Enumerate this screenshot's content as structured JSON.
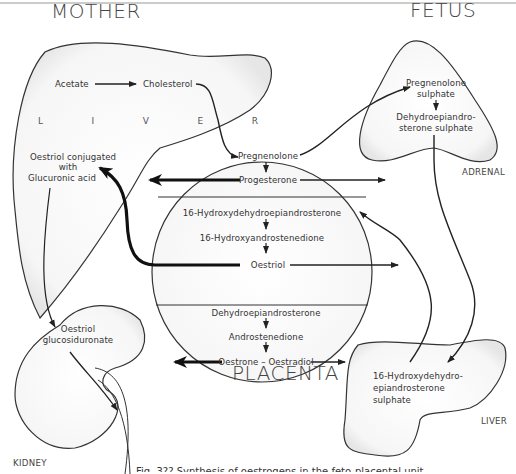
{
  "regions": {
    "mother": "MOTHER",
    "fetus": "FETUS",
    "placenta": "PLACENTA",
    "maternal_liver": "L   I   V   E   R",
    "kidney": "KIDNEY",
    "fetal_adrenal": "ADRENAL",
    "fetal_liver": "LIVER"
  },
  "maternal_liver": {
    "acetate": "Acetate",
    "cholesterol": "Cholesterol",
    "oestriol_conj_line1": "Oestriol conjugated",
    "oestriol_conj_line2": "with",
    "oestriol_conj_line3": "Glucuronic acid"
  },
  "kidney": {
    "line1": "Oestriol",
    "line2": "glucosiduronate"
  },
  "placenta": {
    "pregnenolone": "Pregnenolone",
    "progesterone": "Progesterone",
    "hydroxy_dhea": "16-Hydroxydehydroepiandrosterone",
    "hydroxy_androstenedione": "16-Hydroxyandrostenedione",
    "oestriol": "Oestriol",
    "dhea": "Dehydroepiandrosterone",
    "androstenedione": "Androstenedione",
    "oestrone_oestradiol": "Oestrone – Oestradiol"
  },
  "fetal_adrenal": {
    "preg_sulph_1": "Pregnenolone",
    "preg_sulph_2": "sulphate",
    "dhea_sulph_1": "Dehydroepiandro-",
    "dhea_sulph_2": "sterone sulphate"
  },
  "fetal_liver": {
    "line1": "16-Hydroxydehydro-",
    "line2": "epiandrosterone",
    "line3": "sulphate"
  },
  "caption": "Fig. 3?? Synthesis of oestrogens in the feto-placental unit"
}
